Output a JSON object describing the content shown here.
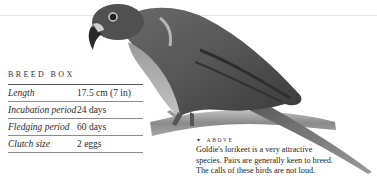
{
  "breed_box": {
    "title": "BREED BOX",
    "rows": [
      {
        "label": "Length",
        "value": "17.5 cm (7 in)"
      },
      {
        "label": "Incubation period",
        "value": "24 days"
      },
      {
        "label": "Fledging period",
        "value": "60 days"
      },
      {
        "label": "Clutch size",
        "value": "2 eggs"
      }
    ]
  },
  "caption": {
    "marker": "✦",
    "heading": "ABOVE",
    "lines": [
      "Goldie's lorikeet is a very attractive",
      "species. Pairs are generally keen to breed.",
      "The calls of these birds are not loud."
    ]
  },
  "image": {
    "subject": "Goldie's lorikeet perched on a branch",
    "tone": "grayscale"
  }
}
